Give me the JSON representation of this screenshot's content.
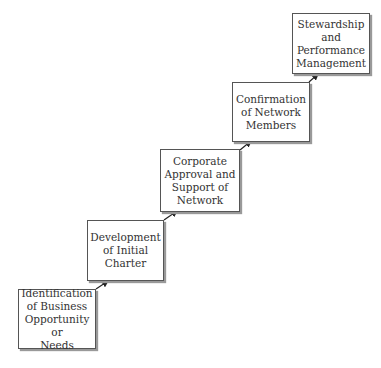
{
  "diagram": {
    "type": "staircase-flow",
    "steps": [
      {
        "id": "step-1",
        "lines": [
          "Identification",
          "of Business",
          "Opportunity or",
          "Needs"
        ]
      },
      {
        "id": "step-2",
        "lines": [
          "Development",
          "of Initial",
          "Charter"
        ]
      },
      {
        "id": "step-3",
        "lines": [
          "Corporate",
          "Approval and",
          "Support of",
          "Network"
        ]
      },
      {
        "id": "step-4",
        "lines": [
          "Confirmation",
          "of Network",
          "Members"
        ]
      },
      {
        "id": "step-5",
        "lines": [
          "Stewardship",
          "and",
          "Performance",
          "Management"
        ]
      }
    ]
  },
  "colors": {
    "border": "#555555",
    "text": "#333333",
    "arrow": "#222222"
  }
}
